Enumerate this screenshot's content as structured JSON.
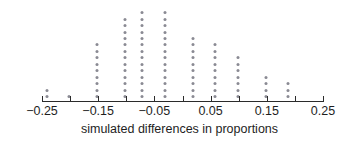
{
  "chart_data": {
    "type": "bar",
    "plot_style": "dotplot",
    "title": "",
    "subtitle": "",
    "xlabel": "simulated differences in proportions",
    "ylabel": "",
    "xlim": [
      -0.28,
      0.28
    ],
    "x_ticks_major": [
      -0.25,
      -0.15,
      -0.05,
      0.05,
      0.15,
      0.25
    ],
    "x_tick_labels": [
      "−0.25",
      "−0.15",
      "−0.05",
      "0.05",
      "0.15",
      "0.25"
    ],
    "x_ticks_minor": [
      -0.2,
      -0.1,
      0.0,
      0.1,
      0.2
    ],
    "grid": false,
    "legend": false,
    "dot_color": "#8a8a93",
    "axis_color": "#2b2b2b",
    "dot_unit": 1,
    "categories": [
      -0.24,
      -0.2,
      -0.15,
      -0.1,
      -0.07,
      -0.03,
      0.02,
      0.06,
      0.1,
      0.15,
      0.19
    ],
    "values": [
      2,
      1,
      9,
      13,
      14,
      14,
      10,
      9,
      7,
      4,
      3
    ],
    "total_dots": 86,
    "annotations": []
  },
  "axis": {
    "title": "simulated differences in proportions",
    "labels": [
      "−0.25",
      "−0.15",
      "−0.05",
      "0.05",
      "0.15",
      "0.25"
    ]
  }
}
